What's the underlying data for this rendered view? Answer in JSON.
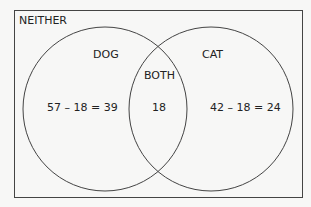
{
  "diagram": {
    "type": "venn",
    "universe_label": "NEITHER",
    "sets": [
      {
        "name": "DOG",
        "total": 57,
        "only_expression": "57 – 18 = 39",
        "only_value": 39
      },
      {
        "name": "CAT",
        "total": 42,
        "only_expression": "42 – 18 = 24",
        "only_value": 24
      }
    ],
    "intersection": {
      "label": "BOTH",
      "value": "18"
    }
  }
}
